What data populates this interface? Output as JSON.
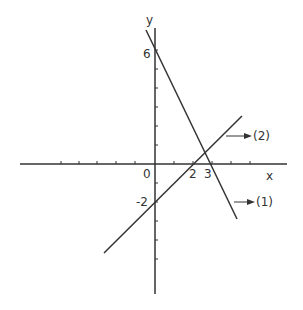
{
  "diagram": {
    "type": "coordinate-graph",
    "axes": {
      "x_label": "x",
      "y_label": "y",
      "origin_label": "0"
    },
    "tick_labels": {
      "x_2": "2",
      "x_3": "3",
      "y_6": "6",
      "y_neg2": "-2"
    },
    "lines": [
      {
        "id": "1",
        "label": "(1)",
        "equation": "y = -2x + 6",
        "x_intercept": 3,
        "y_intercept": 6
      },
      {
        "id": "2",
        "label": "(2)",
        "equation": "y = x - 2",
        "x_intercept": 2,
        "y_intercept": -2
      }
    ],
    "intersection": {
      "x": 2.67,
      "y": 0.67
    },
    "colors": {
      "ink": "#333333",
      "background": "#ffffff"
    }
  }
}
